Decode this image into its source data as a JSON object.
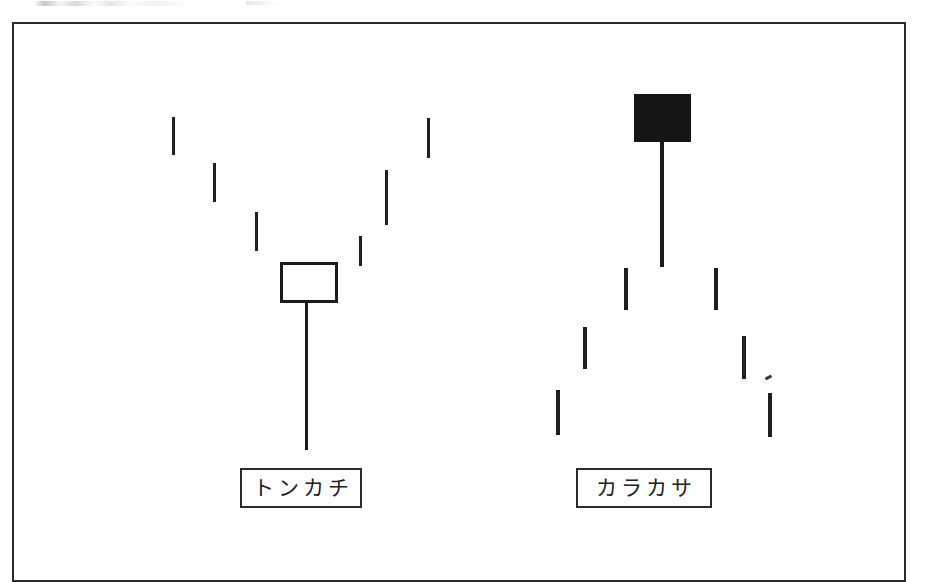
{
  "figure": {
    "type": "candlestick-pattern-diagram",
    "language": "ja",
    "background_color": "#ffffff",
    "ink_color": "#1a1a1a",
    "frame": {
      "x": 12,
      "y": 22,
      "width": 894,
      "height": 560,
      "border_color": "#2b2b2b",
      "border_width": 2
    },
    "artifact_note": "faint scanner smudge at top edge"
  },
  "patterns": [
    {
      "id": "tonkachi",
      "label": "トンカチ",
      "romaji": "Tonkachi",
      "meaning": "hammer",
      "body_style": "hollow",
      "body": {
        "x": 280,
        "y": 262,
        "width": 58,
        "height": 41
      },
      "lower_shadow": {
        "x": 305,
        "y": 302,
        "width": 3,
        "height": 148
      },
      "upper_shadow": null,
      "trend_shape": "v-bottom",
      "caption_box": {
        "x": 240,
        "y": 468,
        "width": 122,
        "height": 40
      },
      "trend_dashes": [
        {
          "x": 172,
          "y": 117,
          "width": 3,
          "height": 38
        },
        {
          "x": 213,
          "y": 163,
          "width": 3,
          "height": 39
        },
        {
          "x": 255,
          "y": 212,
          "width": 3,
          "height": 39
        },
        {
          "x": 359,
          "y": 236,
          "width": 3,
          "height": 30
        },
        {
          "x": 385,
          "y": 170,
          "width": 3,
          "height": 55
        },
        {
          "x": 427,
          "y": 118,
          "width": 3,
          "height": 40
        }
      ]
    },
    {
      "id": "karakasa",
      "label": "カラカサ",
      "romaji": "Karakasa",
      "meaning": "paper umbrella",
      "body_style": "filled",
      "body": {
        "x": 634,
        "y": 94,
        "width": 57,
        "height": 48
      },
      "lower_shadow": {
        "x": 660,
        "y": 142,
        "width": 4,
        "height": 125
      },
      "upper_shadow": null,
      "trend_shape": "inverted-v-peak",
      "caption_box": {
        "x": 576,
        "y": 468,
        "width": 136,
        "height": 40
      },
      "trend_dashes": [
        {
          "x": 556,
          "y": 390,
          "width": 4,
          "height": 45
        },
        {
          "x": 583,
          "y": 327,
          "width": 4,
          "height": 42
        },
        {
          "x": 624,
          "y": 268,
          "width": 4,
          "height": 42
        },
        {
          "x": 714,
          "y": 268,
          "width": 4,
          "height": 42
        },
        {
          "x": 742,
          "y": 336,
          "width": 4,
          "height": 43
        },
        {
          "x": 768,
          "y": 393,
          "width": 4,
          "height": 44
        }
      ],
      "trend_specks": [
        {
          "x": 765,
          "y": 376,
          "width": 7,
          "height": 3
        }
      ]
    }
  ]
}
